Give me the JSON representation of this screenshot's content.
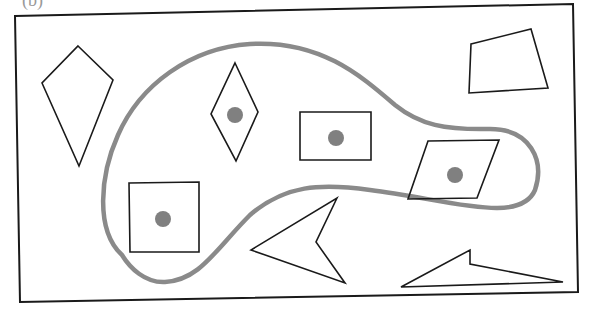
{
  "figure": {
    "partial_label": "(b)",
    "colors": {
      "outline": "#1a1a1a",
      "region_curve": "#8a8a8a",
      "dot": "#808080",
      "background": "#ffffff"
    },
    "frame": {
      "points": "15,16 573,4 578,292 20,302"
    },
    "region": {
      "name": "enclosing-blob",
      "path": "M 122,255 C 95,230 100,175 118,135 C 140,85 190,48 250,44 C 320,40 360,75 395,105 C 420,125 445,130 490,129 C 530,129 545,160 535,190 C 520,225 450,200 370,190 C 320,183 285,185 250,215 C 215,250 200,280 165,282 C 145,283 130,268 122,255 Z"
    },
    "shapes_inside": [
      {
        "name": "rhombus",
        "points": "235,63 258,112 236,161 211,114",
        "dot": {
          "cx": 235,
          "cy": 115,
          "r": 8
        }
      },
      {
        "name": "rectangle",
        "points": "300,112 371,112 371,160 300,160",
        "dot": {
          "cx": 336,
          "cy": 138,
          "r": 8
        }
      },
      {
        "name": "parallelogram",
        "points": "428,141 499,140 477,198 408,199",
        "dot": {
          "cx": 455,
          "cy": 175,
          "r": 8
        }
      },
      {
        "name": "square",
        "points": "129,183 199,182 199,252 130,252",
        "dot": {
          "cx": 163,
          "cy": 219,
          "r": 8
        }
      }
    ],
    "shapes_outside": [
      {
        "name": "kite",
        "points": "78,46 113,80 79,166 42,83"
      },
      {
        "name": "quadrilateral",
        "points": "471,44 531,29 548,88 469,93"
      },
      {
        "name": "arrowhead",
        "points": "337,198 316,242 345,283 251,250"
      },
      {
        "name": "concave-triangle",
        "points": "401,287 470,250 470,264 563,282"
      }
    ]
  }
}
